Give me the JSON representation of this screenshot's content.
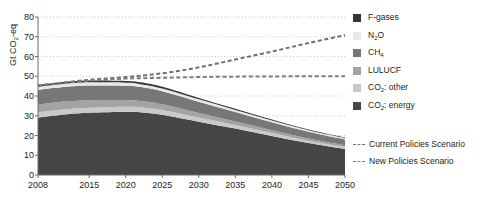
{
  "chart_data": {
    "type": "area",
    "title": "",
    "xlabel": "",
    "ylabel": "Gt CO2-eq",
    "ylabel_prefix": "Gt CO",
    "ylabel_sub": "2",
    "ylabel_suffix": "-eq",
    "xlim": [
      2008,
      2050
    ],
    "ylim": [
      0,
      80
    ],
    "ytick_values": [
      0,
      10,
      20,
      30,
      40,
      50,
      60,
      70,
      80
    ],
    "xtick_values": [
      2008,
      2015,
      2020,
      2025,
      2030,
      2035,
      2040,
      2045,
      2050
    ],
    "grid": "horizontal-dotted",
    "legend_position": "right",
    "stacked": true,
    "x": [
      2008,
      2010,
      2012,
      2015,
      2020,
      2022,
      2025,
      2030,
      2035,
      2040,
      2045,
      2050
    ],
    "series": [
      {
        "name": "CO2: energy",
        "label_prefix": "CO",
        "label_sub": "2",
        "label_suffix": ": energy",
        "color": "#454545",
        "values": [
          29.0,
          30.0,
          30.8,
          31.5,
          32.0,
          31.8,
          30.5,
          27.0,
          23.5,
          19.8,
          16.2,
          13.2
        ]
      },
      {
        "name": "CO2: other",
        "label_prefix": "CO",
        "label_sub": "2",
        "label_suffix": ": other",
        "color": "#c9c9c9",
        "values": [
          2.6,
          2.6,
          2.6,
          2.6,
          2.6,
          2.5,
          2.4,
          2.1,
          1.8,
          1.5,
          1.2,
          1.0
        ]
      },
      {
        "name": "LULUCF",
        "label_prefix": "LULUCF",
        "label_sub": "",
        "label_suffix": "",
        "color": "#a3a3a3",
        "values": [
          4.1,
          4.0,
          3.9,
          3.8,
          3.4,
          3.2,
          2.9,
          2.3,
          1.8,
          1.4,
          1.1,
          0.9
        ]
      },
      {
        "name": "CH4",
        "label_prefix": "CH",
        "label_sub": "4",
        "label_suffix": "",
        "color": "#777777",
        "values": [
          7.3,
          7.4,
          7.4,
          7.4,
          7.2,
          7.0,
          6.6,
          5.7,
          4.8,
          4.0,
          3.4,
          2.9
        ]
      },
      {
        "name": "N2O",
        "label_prefix": "N",
        "label_sub": "2",
        "label_suffix": "O",
        "color": "#e8e8e8",
        "values": [
          1.6,
          1.6,
          1.6,
          1.6,
          1.5,
          1.5,
          1.4,
          1.2,
          1.0,
          0.85,
          0.7,
          0.6
        ]
      },
      {
        "name": "F-gases",
        "label_prefix": "F-gases",
        "label_sub": "",
        "label_suffix": "",
        "color": "#353535",
        "values": [
          0.9,
          0.9,
          0.9,
          0.9,
          0.9,
          0.9,
          0.85,
          0.75,
          0.6,
          0.5,
          0.4,
          0.35
        ]
      }
    ],
    "lines": [
      {
        "name": "Current Policies Scenario",
        "color": "#6f6f6f",
        "style": "dashed",
        "x": [
          2008,
          2010,
          2015,
          2020,
          2025,
          2030,
          2035,
          2040,
          2045,
          2050
        ],
        "values": [
          45.5,
          46.2,
          48.2,
          49.6,
          51.5,
          54.5,
          58.5,
          62.5,
          66.8,
          70.8
        ]
      },
      {
        "name": "New Policies Scenario",
        "color": "#7d7d7d",
        "style": "dashed",
        "x": [
          2008,
          2010,
          2015,
          2020,
          2025,
          2030,
          2035,
          2040,
          2045,
          2050
        ],
        "values": [
          45.5,
          46.0,
          47.8,
          48.8,
          49.2,
          49.6,
          49.8,
          49.9,
          50.0,
          50.0
        ]
      }
    ]
  },
  "legend": {
    "items": [
      {
        "label": "F-gases",
        "color": "#353535"
      },
      {
        "label": "N2O",
        "color": "#e8e8e8"
      },
      {
        "label": "CH4",
        "color": "#777777"
      },
      {
        "label": "LULUCF",
        "color": "#a3a3a3"
      },
      {
        "label": "CO2: other",
        "color": "#c9c9c9"
      },
      {
        "label": "CO2: energy",
        "color": "#454545"
      }
    ],
    "line_items": [
      {
        "label": "Current Policies Scenario",
        "color": "#6f6f6f"
      },
      {
        "label": "New Policies Scenario",
        "color": "#7d7d7d"
      }
    ]
  }
}
